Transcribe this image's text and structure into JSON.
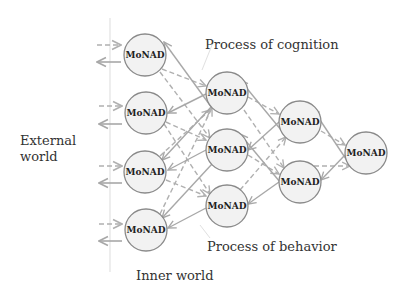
{
  "labels": {
    "external_world": "External\nworld",
    "external_line1": "External",
    "external_line2": "world",
    "inner_world": "Inner world",
    "process_cognition": "Process of cognition",
    "process_behavior": "Process of behavior"
  },
  "node_label": "MoNAD",
  "colors": {
    "node_fill": "#f2f2f2",
    "node_stroke": "#8a8a8a",
    "solid_arrow": "#a8a8a8",
    "dashed_arrow": "#b0b0b0",
    "boundary_line": "#e2e2e2",
    "text": "#333333"
  },
  "nodes": [
    {
      "id": "c1n1",
      "label": "MoNAD",
      "x": 145,
      "y": 55
    },
    {
      "id": "c1n2",
      "label": "MoNAD",
      "x": 146,
      "y": 113
    },
    {
      "id": "c1n3",
      "label": "MoNAD",
      "x": 145,
      "y": 172
    },
    {
      "id": "c1n4",
      "label": "MoNAD",
      "x": 146,
      "y": 230
    },
    {
      "id": "c2n1",
      "label": "MoNAD",
      "x": 227,
      "y": 93
    },
    {
      "id": "c2n2",
      "label": "MoNAD",
      "x": 227,
      "y": 150
    },
    {
      "id": "c2n3",
      "label": "MoNAD",
      "x": 227,
      "y": 206
    },
    {
      "id": "c3n1",
      "label": "MoNAD",
      "x": 300,
      "y": 122
    },
    {
      "id": "c3n2",
      "label": "MoNAD",
      "x": 300,
      "y": 182
    },
    {
      "id": "c4n1",
      "label": "MoNAD",
      "x": 366,
      "y": 153
    }
  ]
}
